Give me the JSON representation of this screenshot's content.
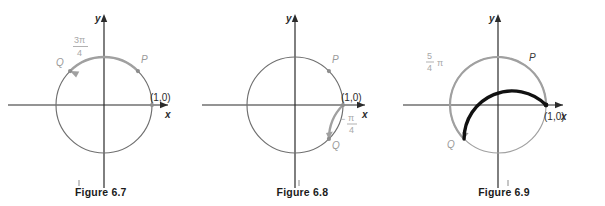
{
  "page": {
    "background_color": "#ffffff",
    "figure_count": 3
  },
  "colors": {
    "circle_stroke": "#6f6f6f",
    "axis_stroke": "#2b2b2b",
    "highlight_gray": "#a0a0a0",
    "highlight_black": "#111111",
    "label_gray": "#a8a8a8",
    "label_dark": "#2b2b2b",
    "caption": "#1b1b1b"
  },
  "figures": [
    {
      "id": "figure-6-7",
      "caption": "Figure 6.7",
      "axis": {
        "x_label": "x",
        "y_label": "y"
      },
      "unit_point_label": "(1,0)",
      "points": [
        {
          "name": "P",
          "label": "P",
          "angle_deg": 45
        },
        {
          "name": "Q",
          "label": "Q",
          "angle_deg": 135
        }
      ],
      "angle_label": {
        "numerator": "3π",
        "denominator": "4",
        "text": "3π/4"
      },
      "arcs": [
        {
          "name": "arc-P-to-Q",
          "color": "#a0a0a0",
          "start_deg": 45,
          "end_deg": 135,
          "direction": "counterclockwise",
          "width": 2.2,
          "arrow_at_end": true
        }
      ]
    },
    {
      "id": "figure-6-8",
      "caption": "Figure 6.8",
      "axis": {
        "x_label": "x",
        "y_label": "y"
      },
      "unit_point_label": "(1,0)",
      "points": [
        {
          "name": "P",
          "label": "P",
          "angle_deg": 45
        },
        {
          "name": "Q",
          "label": "Q",
          "angle_deg": -45
        }
      ],
      "angle_label": {
        "numerator": "π",
        "denominator": "4",
        "text": "-π/4",
        "sign": "−"
      },
      "arcs": [
        {
          "name": "arc-unit-to-Q",
          "color": "#a0a0a0",
          "start_deg": 0,
          "end_deg": -45,
          "direction": "clockwise",
          "width": 2.2,
          "arrow_at_end": true
        }
      ]
    },
    {
      "id": "figure-6-9",
      "caption": "Figure 6.9",
      "axis": {
        "x_label": "x",
        "y_label": "y"
      },
      "unit_point_label": "(1,0)",
      "points": [
        {
          "name": "P",
          "label": "P",
          "angle_deg": 55
        },
        {
          "name": "Q",
          "label": "Q",
          "angle_deg": 225
        }
      ],
      "angle_label": {
        "numerator": "5",
        "denominator": "4",
        "symbol": "π",
        "text": "5/4 π"
      },
      "arcs": [
        {
          "name": "arc-ccw-gray",
          "color": "#a0a0a0",
          "start_deg": 0,
          "end_deg": 225,
          "direction": "counterclockwise",
          "width": 2.2,
          "arrow_at_end": true
        },
        {
          "name": "arc-cw-black",
          "color": "#111111",
          "start_deg": 0,
          "end_deg": 225,
          "direction": "clockwise",
          "width": 3.4,
          "arrow_at_end": false
        }
      ]
    }
  ]
}
